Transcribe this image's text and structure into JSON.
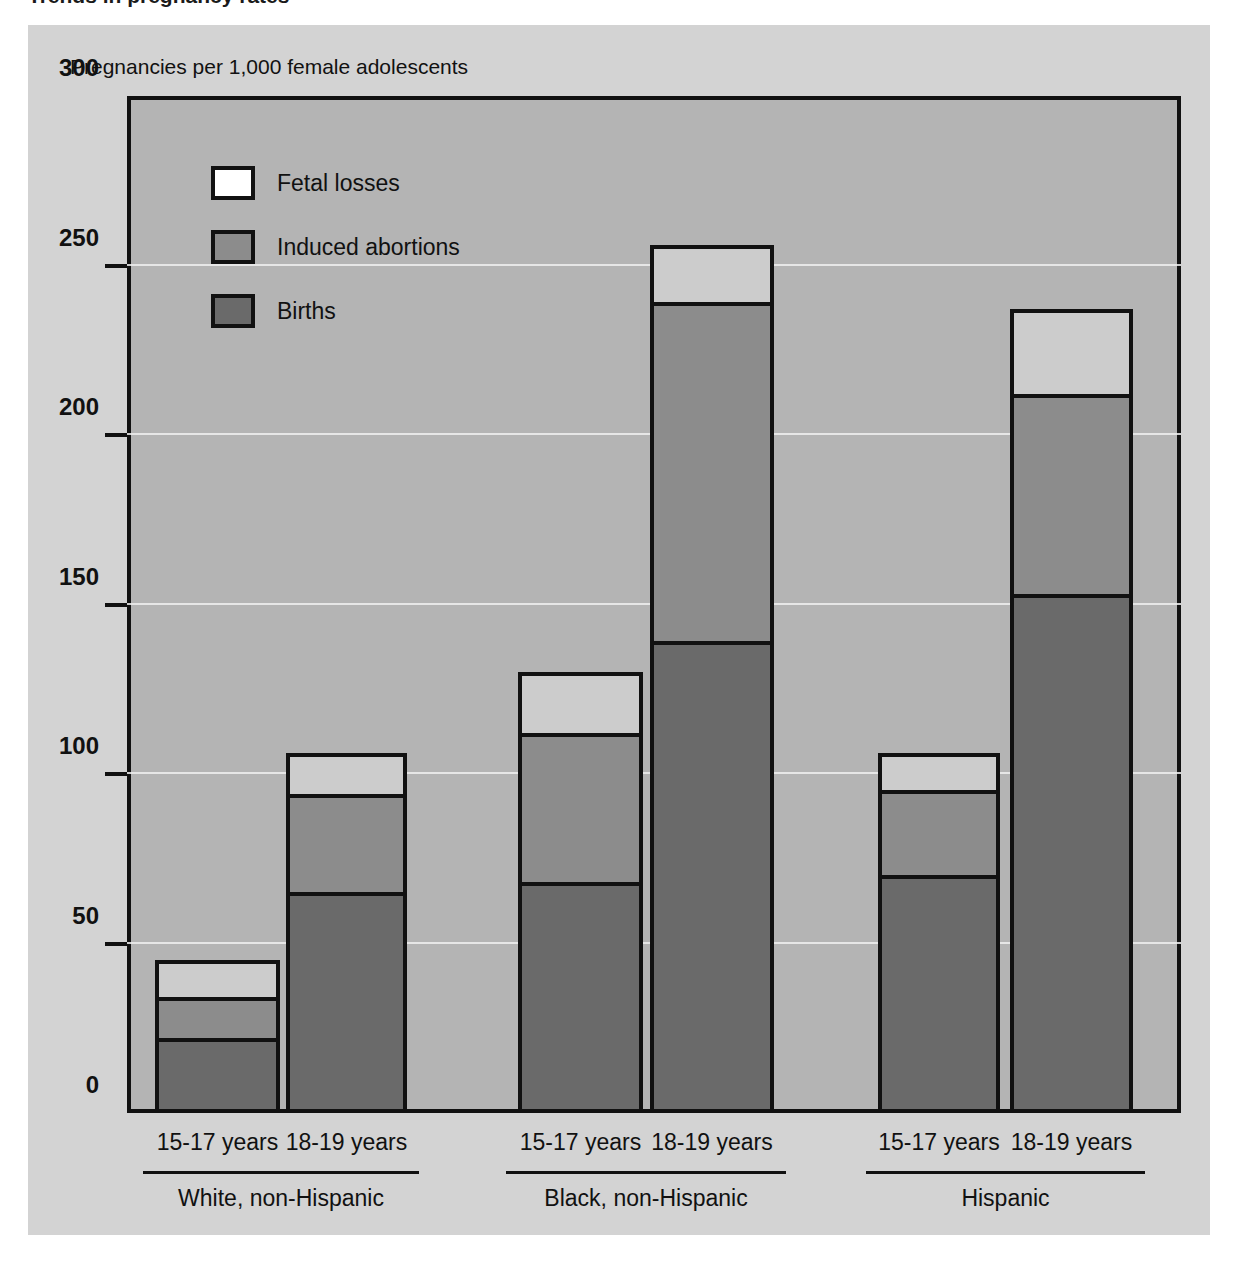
{
  "page": {
    "cut_off_header": "Trends in pregnancy rates",
    "panel_bg": "#d3d3d3",
    "plot_bg": "#b4b4b4"
  },
  "chart_data": {
    "type": "bar",
    "subtype": "stacked",
    "title": "",
    "ylabel": "Pregnancies per 1,000 female adolescents",
    "xlabel": "",
    "ylim": [
      0,
      300
    ],
    "yticks": [
      0,
      50,
      100,
      150,
      200,
      250,
      300
    ],
    "ytick_labels": [
      "0",
      "50",
      "100",
      "150",
      "200",
      "250",
      "300"
    ],
    "grid": true,
    "legend_position": "upper left",
    "categories": [
      "15-17 years",
      "18-19 years",
      "15-17 years",
      "18-19 years",
      "15-17 years",
      "18-19 years"
    ],
    "groups": [
      {
        "label": "White, non-Hispanic",
        "categories": [
          "15-17 years",
          "18-19 years"
        ]
      },
      {
        "label": "Black, non-Hispanic",
        "categories": [
          "15-17 years",
          "18-19 years"
        ]
      },
      {
        "label": "Hispanic",
        "categories": [
          "15-17 years",
          "18-19 years"
        ]
      }
    ],
    "series": [
      {
        "name": "Births",
        "color": "#6a6a6a",
        "values": [
          21,
          64,
          67,
          138,
          69,
          152
        ]
      },
      {
        "name": "Induced abortions",
        "color": "#8c8c8c",
        "values": [
          12,
          29,
          44,
          100,
          25,
          59
        ]
      },
      {
        "name": "Fetal losses",
        "color": "#cccccc",
        "values": [
          11,
          12,
          18,
          17,
          11,
          25
        ]
      }
    ],
    "totals": [
      44,
      105,
      129,
      255,
      105,
      236
    ],
    "stack_tops": {
      "births": [
        21,
        64,
        67,
        138,
        69,
        152
      ],
      "abortions": [
        33,
        93,
        111,
        238,
        94,
        211
      ],
      "fetal": [
        44,
        105,
        129,
        255,
        105,
        236
      ]
    }
  },
  "legend": {
    "items": [
      {
        "label": "Fetal losses",
        "swatch": "sw-fetal"
      },
      {
        "label": "Induced abortions",
        "swatch": "sw-abortions"
      },
      {
        "label": "Births",
        "swatch": "sw-births"
      }
    ]
  }
}
